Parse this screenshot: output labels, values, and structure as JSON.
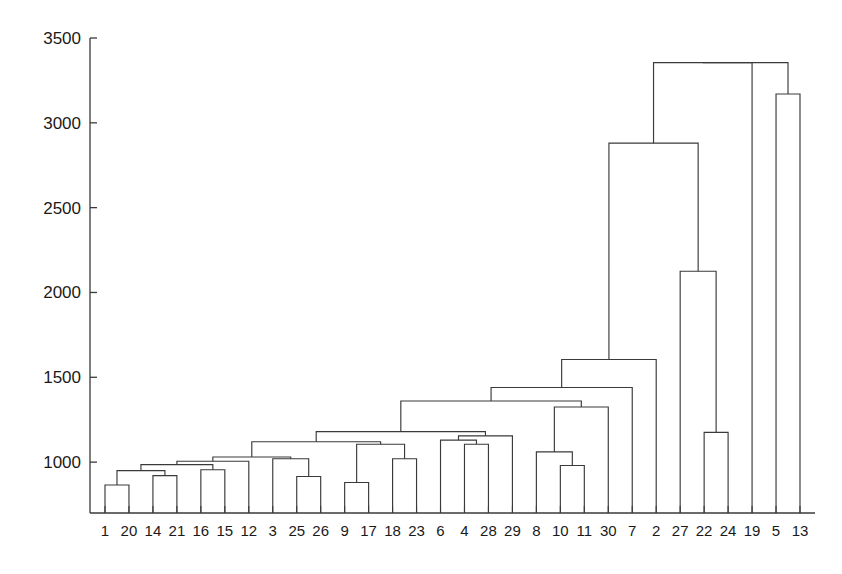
{
  "chart_data": {
    "type": "dendrogram",
    "title": "",
    "xlabel": "",
    "ylabel": "",
    "grid": false,
    "legend": null,
    "yaxis": {
      "ticks": [
        1000,
        1500,
        2000,
        2500,
        3000,
        3500
      ],
      "tick_labels": [
        "1000",
        "1500",
        "2000",
        "2500",
        "3000",
        "3500"
      ],
      "ylim": [
        700,
        3500
      ],
      "baseline_value": 700
    },
    "xaxis": {
      "leaf_labels": [
        "1",
        "20",
        "14",
        "21",
        "16",
        "15",
        "12",
        "3",
        "25",
        "26",
        "9",
        "17",
        "18",
        "23",
        "6",
        "4",
        "28",
        "29",
        "8",
        "10",
        "11",
        "30",
        "7",
        "2",
        "27",
        "22",
        "24",
        "19",
        "5",
        "13"
      ],
      "n_leaves": 30
    },
    "colors": {
      "line": "#3a3a3a",
      "axis": "#3a3a3a",
      "background": "#ffffff",
      "text": "#1a1a1a"
    },
    "merges": [
      {
        "id": "m1",
        "left": "1",
        "right": "20",
        "height": 865
      },
      {
        "id": "m2",
        "left": "14",
        "right": "21",
        "height": 920
      },
      {
        "id": "m3",
        "left": "m1",
        "right": "m2",
        "height": 950
      },
      {
        "id": "m4",
        "left": "16",
        "right": "15",
        "height": 955
      },
      {
        "id": "m5",
        "left": "m3",
        "right": "m4",
        "height": 985
      },
      {
        "id": "m6",
        "left": "25",
        "right": "26",
        "height": 915
      },
      {
        "id": "m7",
        "left": "3",
        "right": "m6",
        "height": 1020
      },
      {
        "id": "m8",
        "left": "m5",
        "right": "12",
        "height": 1005
      },
      {
        "id": "m9",
        "left": "m8",
        "right": "m7",
        "height": 1030
      },
      {
        "id": "m10",
        "left": "9",
        "right": "17",
        "height": 880
      },
      {
        "id": "m11",
        "left": "18",
        "right": "23",
        "height": 1020
      },
      {
        "id": "m12",
        "left": "m10",
        "right": "m11",
        "height": 1105
      },
      {
        "id": "m13",
        "left": "m9",
        "right": "m12",
        "height": 1120
      },
      {
        "id": "m14",
        "left": "4",
        "right": "28",
        "height": 1105
      },
      {
        "id": "m15",
        "left": "6",
        "right": "m14",
        "height": 1130
      },
      {
        "id": "m16",
        "left": "m15",
        "right": "29",
        "height": 1155
      },
      {
        "id": "m17",
        "left": "m13",
        "right": "m16",
        "height": 1180
      },
      {
        "id": "m18",
        "left": "10",
        "right": "11",
        "height": 980
      },
      {
        "id": "m19",
        "left": "8",
        "right": "m18",
        "height": 1060
      },
      {
        "id": "m20",
        "left": "m19",
        "right": "30",
        "height": 1325
      },
      {
        "id": "m21",
        "left": "m17",
        "right": "m20",
        "height": 1360
      },
      {
        "id": "m22",
        "left": "m21",
        "right": "7",
        "height": 1440
      },
      {
        "id": "m23",
        "left": "m22",
        "right": "2",
        "height": 1605
      },
      {
        "id": "m24",
        "left": "22",
        "right": "24",
        "height": 1175
      },
      {
        "id": "m25",
        "left": "27",
        "right": "m24",
        "height": 2125
      },
      {
        "id": "m26",
        "left": "m23",
        "right": "m25",
        "height": 2880
      },
      {
        "id": "m27",
        "left": "5",
        "right": "13",
        "height": 3170
      },
      {
        "id": "m28",
        "left": "m26",
        "right": "19",
        "height": 3355
      },
      {
        "id": "m29",
        "left": "m28",
        "right": "m27",
        "height": 3355
      }
    ]
  }
}
